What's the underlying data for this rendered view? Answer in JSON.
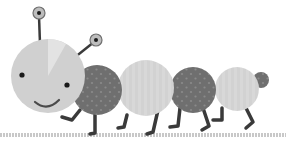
{
  "illustration": {
    "subject": "caterpillar",
    "colors": {
      "background": "#ffffff",
      "light_segment": "#d2d2d2",
      "light_segment_stripe": "#dcdcdc",
      "dark_segment": "#6f6f6f",
      "dark_dot": "#8a8a8a",
      "legs": "#3a3a3a",
      "eye": "#1a1a1a",
      "eyestalk_ball": "#bdbdbd",
      "ground": "#c8c8c8"
    }
  }
}
